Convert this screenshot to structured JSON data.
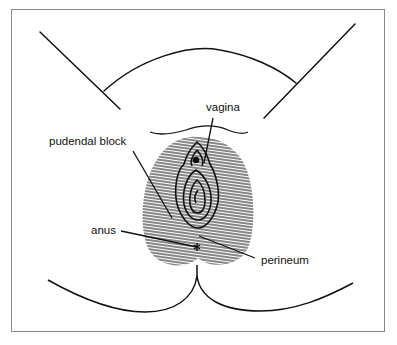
{
  "figure": {
    "labels": {
      "vagina": "vagina",
      "pudendal_block": "pudendal block",
      "anus": "anus",
      "perineum": "perineum"
    },
    "colors": {
      "line": "#111111",
      "frame": "#8a8a8a",
      "background": "#ffffff"
    }
  }
}
